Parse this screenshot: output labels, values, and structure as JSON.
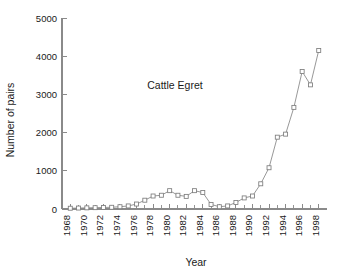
{
  "chart_data": {
    "type": "line",
    "title": "",
    "annotation": "Cattle Egret",
    "xlabel": "Year",
    "ylabel": "Number of pairs",
    "xlim": [
      1967,
      1999
    ],
    "ylim": [
      0,
      5000
    ],
    "grid": false,
    "legend": null,
    "marker": "open-square",
    "line_color": "#8c8c8c",
    "marker_face_color": "#ffffff",
    "marker_edge_color": "#7d7d7d",
    "y_ticks": [
      0,
      1000,
      2000,
      3000,
      4000,
      5000
    ],
    "y_tick_labels": [
      "0",
      "1000",
      "2000",
      "3000",
      "4000",
      "5000"
    ],
    "x_ticks_major": [
      1968,
      1970,
      1972,
      1974,
      1976,
      1978,
      1980,
      1982,
      1984,
      1986,
      1988,
      1990,
      1992,
      1994,
      1996,
      1998
    ],
    "x_tick_labels": [
      "1968",
      "1970",
      "1972",
      "1974",
      "1976",
      "1978",
      "1980",
      "1982",
      "1984",
      "1986",
      "1988",
      "1990",
      "1992",
      "1994",
      "1996",
      "1998"
    ],
    "x_ticks_minor_every": 1,
    "x_tick_label_rotation": 90,
    "x": [
      1968,
      1969,
      1970,
      1971,
      1972,
      1973,
      1974,
      1975,
      1976,
      1977,
      1978,
      1979,
      1980,
      1981,
      1982,
      1983,
      1984,
      1985,
      1986,
      1987,
      1988,
      1989,
      1990,
      1991,
      1992,
      1993,
      1994,
      1995,
      1996,
      1997,
      1998
    ],
    "values": [
      20,
      25,
      30,
      35,
      40,
      45,
      60,
      80,
      130,
      230,
      340,
      360,
      480,
      360,
      330,
      480,
      430,
      120,
      60,
      80,
      170,
      290,
      340,
      660,
      1080,
      1880,
      1960,
      2660,
      3600,
      3250,
      4150
    ],
    "series": [
      {
        "name": "Cattle Egret",
        "values": [
          20,
          25,
          30,
          35,
          40,
          45,
          60,
          80,
          130,
          230,
          340,
          360,
          480,
          360,
          330,
          480,
          430,
          120,
          60,
          80,
          170,
          290,
          340,
          660,
          1080,
          1880,
          1960,
          2660,
          3600,
          3250,
          4150
        ]
      }
    ]
  }
}
